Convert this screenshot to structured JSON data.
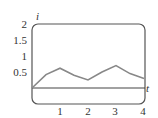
{
  "chart_data": {
    "type": "line",
    "title": "",
    "xlabel": "t",
    "ylabel": "i",
    "xlim": [
      0,
      4
    ],
    "ylim": [
      -0.5,
      2
    ],
    "xticks": [
      "1",
      "2",
      "3",
      "4"
    ],
    "yticks": [
      "0.5",
      "1",
      "1.5",
      "2"
    ],
    "grid": false,
    "series": [
      {
        "name": "i(t)",
        "x": [
          0,
          0.5,
          1,
          1.5,
          2,
          2.5,
          3,
          3.5,
          4
        ],
        "y": [
          0,
          0.42,
          0.62,
          0.4,
          0.25,
          0.5,
          0.7,
          0.45,
          0.3
        ]
      }
    ]
  },
  "labels": {
    "x_axis": "t",
    "y_axis": "i",
    "y_tick_0": "0.5",
    "y_tick_1": "1",
    "y_tick_2": "1.5",
    "y_tick_3": "2",
    "x_tick_0": "1",
    "x_tick_1": "2",
    "x_tick_2": "3",
    "x_tick_3": "4"
  },
  "colors": {
    "frame": "#555555",
    "curve": "#888888",
    "axis": "#444444"
  }
}
